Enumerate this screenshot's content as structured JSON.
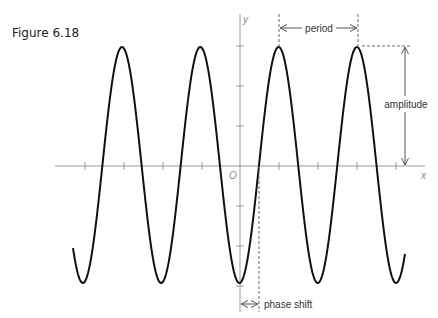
{
  "figure": {
    "caption": "Figure 6.18",
    "labels": {
      "x_axis": "x",
      "y_axis": "y",
      "origin": "O",
      "period": "period",
      "amplitude": "amplitude",
      "phase_shift": "phase shift"
    },
    "colors": {
      "curve": "#111111",
      "axis": "#9a9a9a",
      "annotation": "#444444"
    }
  },
  "chart_data": {
    "type": "line",
    "title": "Figure 6.18",
    "function": "y = A cos(B(x - C)), shifted cosine with minimum at x slightly left of origin",
    "xlabel": "x",
    "ylabel": "y",
    "annotations": [
      "period",
      "amplitude",
      "phase shift"
    ],
    "x_ticks_per_period": 2,
    "y_ticks": [
      3,
      2,
      1,
      0,
      -1,
      -2,
      -3
    ],
    "amplitude_ticks": 3,
    "peaks_count": 4,
    "troughs_count": 5,
    "grid": false
  }
}
